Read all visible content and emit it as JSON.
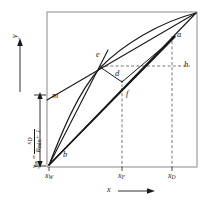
{
  "figure": {
    "type": "mccabe-thiele-diagram",
    "background": "#ffffff",
    "line_color": "#1a1a1a",
    "dash_color": "#555555",
    "frame": {
      "x0": 47,
      "y0": 12,
      "x1": 197,
      "y1": 167
    }
  },
  "axes": {
    "x_arrow_label": "x",
    "y_arrow_label": "y",
    "x_ticks": [
      {
        "id": "xW",
        "base": "x",
        "sub": "W",
        "px": 55
      },
      {
        "id": "xF",
        "base": "x",
        "sub": "F",
        "px": 122
      },
      {
        "id": "xD",
        "base": "x",
        "sub": "D",
        "px": 172
      }
    ],
    "y_label_expression": {
      "lhs_base": "y",
      "lhs_sub": "m",
      "equals": "=",
      "numerator_base": "x",
      "numerator_sub": "D",
      "denominator_base": "R",
      "denominator_sub": "min",
      "denominator_tail": "+ 1"
    }
  },
  "point_labels": [
    {
      "name": "a",
      "text": "a",
      "x": 177,
      "y": 36
    },
    {
      "name": "b",
      "text": "b",
      "x": 63,
      "y": 153
    },
    {
      "name": "d",
      "text": "d",
      "x": 115,
      "y": 74
    },
    {
      "name": "e",
      "text": "e",
      "x": 97,
      "y": 55
    },
    {
      "name": "f",
      "text": "f",
      "x": 126,
      "y": 94
    },
    {
      "name": "h",
      "text": "h",
      "x": 183,
      "y": 65
    },
    {
      "name": "m",
      "text": "m",
      "x": 52,
      "y": 95
    }
  ],
  "curves": {
    "equilibrium_curve": "b-to-topright-convex",
    "diagonal": "b-to-topright-straight",
    "operating_line_upper": "m-through-e-to-topright",
    "rays_from_b": 3
  },
  "dashed_guides": {
    "vertical_xF": 122,
    "vertical_xD": 172,
    "horizontal_h": 70,
    "vertical_d_to_f": true
  },
  "faint_header_artifact": "▪ ▪ ▪ ▪ ▪ ▪"
}
